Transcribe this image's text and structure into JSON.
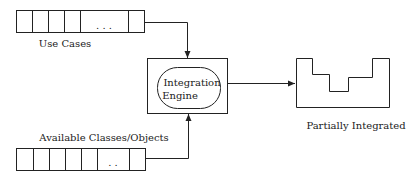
{
  "diagram": {
    "use_cases": {
      "label": "Use Cases",
      "ellipsis": ". . ."
    },
    "available": {
      "label": "Available Classes/Objects",
      "ellipsis": ". ."
    },
    "engine": {
      "line1": "Integration",
      "line2": "Engine"
    },
    "output": {
      "label": "Partially Integrated"
    }
  }
}
